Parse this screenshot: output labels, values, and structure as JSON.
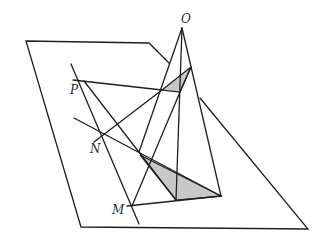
{
  "diagram": {
    "type": "3d-geometry",
    "labels": {
      "O": "O",
      "P": "P",
      "N": "N",
      "M": "M"
    },
    "colors": {
      "line": "#1e1e1e",
      "shade": "#c8c8c8",
      "background": "#ffffff"
    },
    "points": {
      "O": [
        182,
        28
      ],
      "P": [
        84,
        81
      ],
      "N": [
        104,
        135
      ],
      "M": [
        132,
        206
      ],
      "A1": [
        162,
        90
      ],
      "B1": [
        191,
        67
      ],
      "C1": [
        180,
        92
      ],
      "A2": [
        140,
        155
      ],
      "B2": [
        176,
        200
      ],
      "C2": [
        221,
        196
      ]
    },
    "plane": [
      [
        26,
        41
      ],
      [
        149,
        43
      ],
      [
        169,
        63
      ],
      [
        200,
        98
      ],
      [
        308,
        229
      ],
      [
        81,
        227
      ]
    ]
  }
}
